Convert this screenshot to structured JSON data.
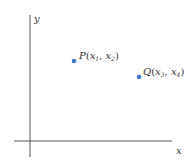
{
  "diagram": {
    "axes": {
      "x_label": "x",
      "y_label": "y",
      "axis_color": "#555555"
    },
    "points": [
      {
        "name": "P",
        "coord1": "x",
        "sub1": "1",
        "coord2": "x",
        "sub2": "2",
        "color": "#3a78c9"
      },
      {
        "name": "Q",
        "coord1": "x",
        "sub1": "3",
        "coord2": "x",
        "sub2": "4",
        "color": "#3a78c9"
      }
    ],
    "punct": {
      "open": "(",
      "comma": ", ",
      "close": ")"
    }
  }
}
